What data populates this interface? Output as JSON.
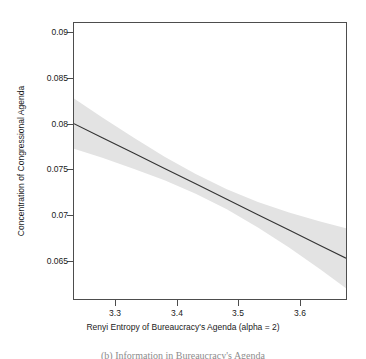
{
  "chart_data": {
    "type": "line",
    "title": "",
    "subtitle": "",
    "xlabel": "Renyi Entropy of Bureaucracy's Agenda (alpha = 2)",
    "ylabel": "Concentration of Congressional Agenda",
    "xlim": [
      3.2345,
      3.6715
    ],
    "ylim": [
      0.06155,
      0.09185
    ],
    "xticks": [
      3.3,
      3.4,
      3.5,
      3.6
    ],
    "xtick_labels": [
      "3.3",
      "3.4",
      "3.5",
      "3.6"
    ],
    "yticks": [
      0.09,
      0.085,
      0.08,
      0.075,
      0.07,
      0.065
    ],
    "ytick_labels": [
      "0.09",
      "0.085",
      "0.08",
      "0.075",
      "0.07",
      "0.065"
    ],
    "grid": false,
    "legend": null,
    "legend_position": "none",
    "series": [
      {
        "name": "Fitted regression line",
        "type": "line",
        "color": "#333333",
        "x": [
          3.2345,
          3.28,
          3.33,
          3.38,
          3.43,
          3.48,
          3.53,
          3.58,
          3.63,
          3.6715
        ],
        "y": [
          0.0808,
          0.07926,
          0.07757,
          0.07588,
          0.07419,
          0.0725,
          0.07081,
          0.06912,
          0.06743,
          0.06603
        ]
      },
      {
        "name": "95% confidence band",
        "type": "area",
        "color": "#e3e3e3",
        "x": [
          3.2345,
          3.28,
          3.33,
          3.38,
          3.43,
          3.48,
          3.53,
          3.58,
          3.63,
          3.6715
        ],
        "y_upper": [
          0.08355,
          0.08147,
          0.07928,
          0.07718,
          0.07527,
          0.07361,
          0.07221,
          0.07104,
          0.07005,
          0.06933
        ],
        "y_lower": [
          0.07805,
          0.07705,
          0.07586,
          0.07458,
          0.07311,
          0.07139,
          0.06941,
          0.0672,
          0.06481,
          0.06273
        ]
      }
    ],
    "annotations": []
  },
  "figure": {
    "caption": "(b) Information in Bureaucracy's Agenda"
  }
}
